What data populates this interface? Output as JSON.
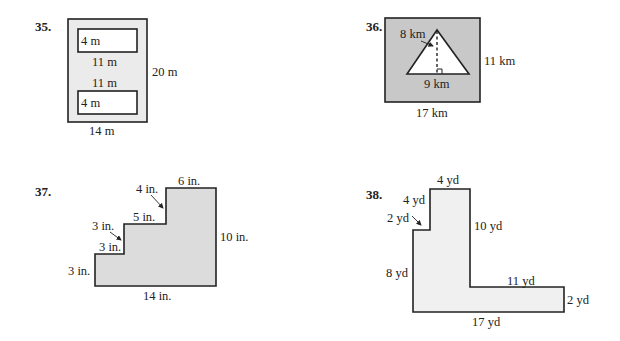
{
  "problems": [
    {
      "number": "35.",
      "shape": "rectangle with two inner white rectangles",
      "fill_color": "#ebebeb",
      "labels": {
        "top_rect_height": "4 m",
        "top_rect_width": "11 m",
        "bottom_rect_width": "11 m",
        "bottom_rect_height": "4 m",
        "outer_height": "20 m",
        "outer_width": "14 m"
      }
    },
    {
      "number": "36.",
      "shape": "rectangle with inner white triangle",
      "fill_color": "#c8c8c8",
      "labels": {
        "triangle_height": "8 km",
        "triangle_base": "9 km",
        "outer_height": "11 km",
        "outer_width": "17 km"
      }
    },
    {
      "number": "37.",
      "shape": "staircase polygon",
      "fill_color": "#dcdcdc",
      "labels": {
        "top_width": "6 in.",
        "step3_rise": "4 in.",
        "step2_tread": "5 in.",
        "step2_rise": "3 in.",
        "step1_tread": "3 in.",
        "left_height": "3 in.",
        "right_height": "10 in.",
        "bottom_width": "14 in."
      }
    },
    {
      "number": "38.",
      "shape": "L-shaped polygon",
      "fill_color": "#f0f0f0",
      "labels": {
        "top_width": "4 yd",
        "upper_left_height": "4 yd",
        "notch_width": "2 yd",
        "inner_vertical": "10 yd",
        "left_height": "8 yd",
        "inner_horizontal": "11 yd",
        "right_height": "2 yd",
        "bottom_width": "17 yd"
      }
    }
  ]
}
